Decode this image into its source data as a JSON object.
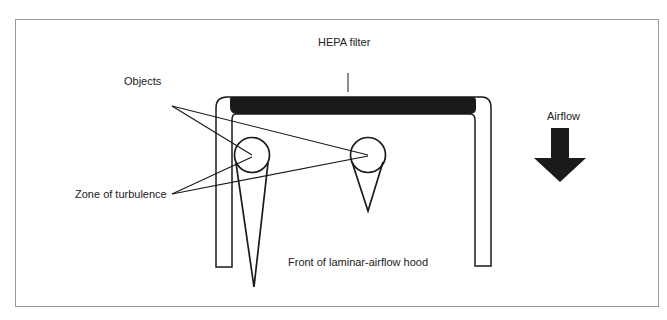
{
  "diagram": {
    "labels": {
      "hepa_filter": "HEPA filter",
      "objects": "Objects",
      "zone_of_turbulence": "Zone of turbulence",
      "airflow": "Airflow",
      "front_of_hood": "Front of laminar-airflow hood"
    },
    "colors": {
      "stroke": "#1a1a1a",
      "filter_fill": "#1a1a1a",
      "frame_border": "#9a9a9a",
      "text": "#222222"
    },
    "elements": [
      "hood-frame",
      "hepa-filter",
      "object-left",
      "object-right",
      "turbulence-zone-left",
      "turbulence-zone-right",
      "airflow-arrow"
    ]
  }
}
